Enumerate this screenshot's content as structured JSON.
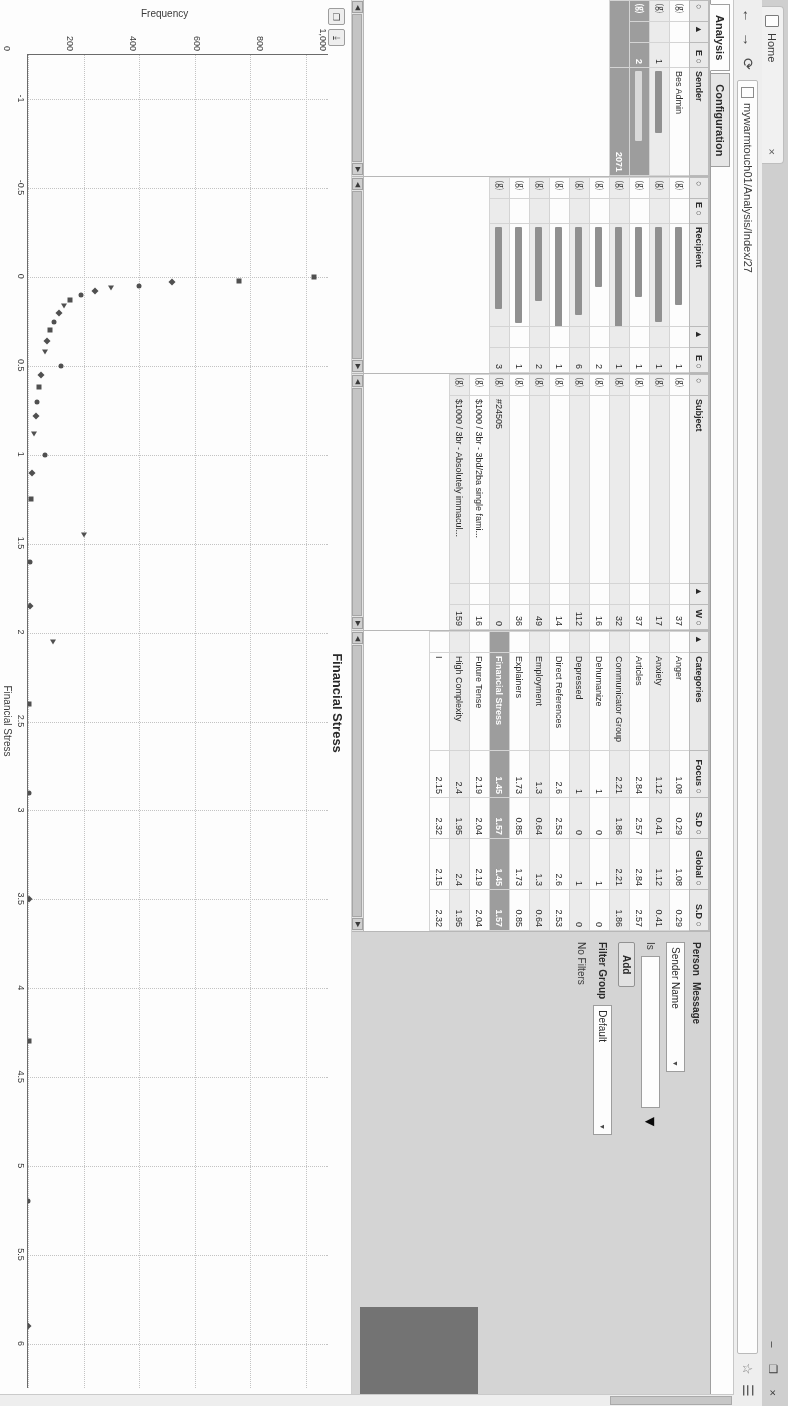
{
  "browser": {
    "tab_title": "Home",
    "tab_close": "×",
    "back_icon": "←",
    "forward_icon": "→",
    "reload_icon": "⟳",
    "url": "mywarmtouch01/Analysis/Index/27",
    "star_icon": "☆",
    "menu_icon": "☰",
    "win_minimize": "–",
    "win_maximize": "❐",
    "win_close": "×"
  },
  "app_tabs": [
    {
      "label": "Analysis",
      "active": true
    },
    {
      "label": "Configuration",
      "active": false
    }
  ],
  "sender_grid": {
    "headers": [
      "○",
      "▲",
      "E ○",
      "Sender"
    ],
    "rows": [
      {
        "c0": "⒢",
        "c1": "",
        "c2": "",
        "name": "Bes Admin",
        "alt": false
      },
      {
        "c0": "⒢",
        "c1": "",
        "c2": "1",
        "name": "█████ ███",
        "alt": true
      },
      {
        "c0": "⒢",
        "c1": "",
        "c2": "2",
        "name": "████ █ ████",
        "alt": false,
        "selected": true
      }
    ],
    "selected_count": "2071"
  },
  "recipient_grid": {
    "headers": [
      "○",
      "E ○",
      "Recipient",
      "▲",
      "E ○"
    ],
    "rows": [
      {
        "c0": "⒢",
        "count": "1"
      },
      {
        "c0": "⒢",
        "count": "1"
      },
      {
        "c0": "⒢",
        "count": "1"
      },
      {
        "c0": "⒢",
        "count": "1"
      },
      {
        "c0": "⒢",
        "count": "2"
      },
      {
        "c0": "⒢",
        "count": "6"
      },
      {
        "c0": "⒢",
        "count": "1"
      },
      {
        "c0": "⒢",
        "count": "2"
      },
      {
        "c0": "⒢",
        "count": "1"
      },
      {
        "c0": "⒢",
        "count": "3"
      }
    ]
  },
  "subject_grid": {
    "headers": [
      "○",
      "Subject",
      "▲",
      "W ○"
    ],
    "rows": [
      {
        "c0": "⒢",
        "subject": "",
        "w": "37"
      },
      {
        "c0": "⒢",
        "subject": "",
        "w": "17"
      },
      {
        "c0": "⒢",
        "subject": "",
        "w": "37"
      },
      {
        "c0": "⒢",
        "subject": "",
        "w": "32"
      },
      {
        "c0": "⒢",
        "subject": "",
        "w": "16"
      },
      {
        "c0": "⒢",
        "subject": "",
        "w": "112"
      },
      {
        "c0": "⒢",
        "subject": "",
        "w": "14"
      },
      {
        "c0": "⒢",
        "subject": "",
        "w": "49"
      },
      {
        "c0": "⒢",
        "subject": "",
        "w": "36"
      },
      {
        "c0": "⒢",
        "subject": "#24505",
        "w": "0"
      },
      {
        "c0": "⒢",
        "subject": "$1000 / 3br - 3bd/2ba single fami...",
        "w": "16"
      },
      {
        "c0": "⒢",
        "subject": "$1000 / 3br - Absolutely immacul...",
        "w": "159"
      }
    ]
  },
  "categories_grid": {
    "headers": [
      "▲",
      "Categories",
      "Focus ○",
      "S.D ○",
      "Global ○",
      "S.D ○"
    ],
    "rows": [
      {
        "name": "Anger",
        "focus": "1.08",
        "sd1": "0.29",
        "global": "1.08",
        "sd2": "0.29",
        "alt": false
      },
      {
        "name": "Anxiety",
        "focus": "1.12",
        "sd1": "0.41",
        "global": "1.12",
        "sd2": "0.41",
        "alt": true
      },
      {
        "name": "Articles",
        "focus": "2.84",
        "sd1": "2.57",
        "global": "2.84",
        "sd2": "2.57",
        "alt": false
      },
      {
        "name": "Communicator Group",
        "focus": "2.21",
        "sd1": "1.86",
        "global": "2.21",
        "sd2": "1.86",
        "alt": true
      },
      {
        "name": "Dehumanize",
        "focus": "1",
        "sd1": "0",
        "global": "1",
        "sd2": "0",
        "alt": false
      },
      {
        "name": "Depressed",
        "focus": "1",
        "sd1": "0",
        "global": "1",
        "sd2": "0",
        "alt": true
      },
      {
        "name": "Direct References",
        "focus": "2.6",
        "sd1": "2.53",
        "global": "2.6",
        "sd2": "2.53",
        "alt": false
      },
      {
        "name": "Employment",
        "focus": "1.3",
        "sd1": "0.64",
        "global": "1.3",
        "sd2": "0.64",
        "alt": true
      },
      {
        "name": "Explainers",
        "focus": "1.73",
        "sd1": "0.85",
        "global": "1.73",
        "sd2": "0.85",
        "alt": false
      },
      {
        "name": "Financial Stress",
        "focus": "1.45",
        "sd1": "1.57",
        "global": "1.45",
        "sd2": "1.57",
        "alt": false,
        "selected": true
      },
      {
        "name": "Future Tense",
        "focus": "2.19",
        "sd1": "2.04",
        "global": "2.19",
        "sd2": "2.04",
        "alt": false
      },
      {
        "name": "High Complexity",
        "focus": "2.4",
        "sd1": "1.95",
        "global": "2.4",
        "sd2": "1.95",
        "alt": true
      },
      {
        "name": "I",
        "focus": "2.15",
        "sd1": "2.32",
        "global": "2.15",
        "sd2": "2.32",
        "alt": false
      }
    ]
  },
  "filters_panel": {
    "person_tab": "Person",
    "message_tab": "Message",
    "field_label": "Sender Name",
    "operator_label": "Is",
    "value": "",
    "add_button": "Add",
    "filter_group_label": "Filter Group",
    "filter_group_value": "Default",
    "no_filters_text": "No Filters"
  },
  "chart_tools": {
    "copy_icon": "❐",
    "download_icon": "⤓"
  },
  "chart_data": {
    "type": "scatter",
    "title": "Financial Stress",
    "xlabel": "Financial Stress",
    "ylabel": "Frequency",
    "xlim": [
      -1.25,
      6.25
    ],
    "ylim": [
      0,
      1080
    ],
    "xticks": [
      -1,
      -0.5,
      0,
      0.5,
      1,
      1.5,
      2,
      2.5,
      3,
      3.5,
      4,
      4.5,
      5,
      5.5,
      6
    ],
    "xtick_labels": [
      "-1",
      "-0.5",
      "0",
      "0.5",
      "1",
      "1.5",
      "2",
      "2.5",
      "3",
      "3.5",
      "4",
      "4.5",
      "5",
      "5.5",
      "6"
    ],
    "yticks": [
      0,
      200,
      400,
      600,
      800,
      1000
    ],
    "ytick_labels": [
      "0",
      "200",
      "400",
      "600",
      "800",
      "1,000"
    ],
    "grid": true,
    "legend": "none",
    "points": [
      {
        "x": 0.0,
        "y": 1030,
        "m": "sq"
      },
      {
        "x": 0.02,
        "y": 760,
        "m": "sq"
      },
      {
        "x": 0.03,
        "y": 520,
        "m": "d"
      },
      {
        "x": 0.05,
        "y": 400,
        "m": "c"
      },
      {
        "x": 0.06,
        "y": 300,
        "m": "t"
      },
      {
        "x": 0.08,
        "y": 240,
        "m": "d"
      },
      {
        "x": 0.1,
        "y": 190,
        "m": "c"
      },
      {
        "x": 0.13,
        "y": 150,
        "m": "sq"
      },
      {
        "x": 0.16,
        "y": 130,
        "m": "t"
      },
      {
        "x": 0.2,
        "y": 110,
        "m": "d"
      },
      {
        "x": 0.25,
        "y": 95,
        "m": "c"
      },
      {
        "x": 0.3,
        "y": 80,
        "m": "sq"
      },
      {
        "x": 0.36,
        "y": 70,
        "m": "d"
      },
      {
        "x": 0.42,
        "y": 60,
        "m": "t"
      },
      {
        "x": 0.5,
        "y": 120,
        "m": "c"
      },
      {
        "x": 0.55,
        "y": 48,
        "m": "d"
      },
      {
        "x": 0.62,
        "y": 40,
        "m": "sq"
      },
      {
        "x": 0.7,
        "y": 34,
        "m": "c"
      },
      {
        "x": 0.78,
        "y": 28,
        "m": "d"
      },
      {
        "x": 0.88,
        "y": 22,
        "m": "t"
      },
      {
        "x": 1.0,
        "y": 60,
        "m": "c"
      },
      {
        "x": 1.1,
        "y": 16,
        "m": "d"
      },
      {
        "x": 1.25,
        "y": 12,
        "m": "sq"
      },
      {
        "x": 1.45,
        "y": 200,
        "m": "t"
      },
      {
        "x": 1.6,
        "y": 8,
        "m": "c"
      },
      {
        "x": 1.85,
        "y": 6,
        "m": "d"
      },
      {
        "x": 2.05,
        "y": 90,
        "m": "t"
      },
      {
        "x": 2.4,
        "y": 4,
        "m": "sq"
      },
      {
        "x": 2.9,
        "y": 3,
        "m": "c"
      },
      {
        "x": 3.5,
        "y": 2,
        "m": "d"
      },
      {
        "x": 4.3,
        "y": 2,
        "m": "sq"
      },
      {
        "x": 5.2,
        "y": 1,
        "m": "c"
      },
      {
        "x": 5.9,
        "y": 1,
        "m": "d"
      }
    ]
  }
}
